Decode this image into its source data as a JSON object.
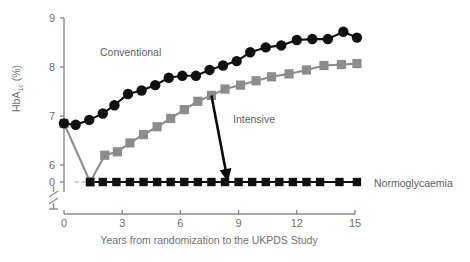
{
  "figure": {
    "background": "#ffffff",
    "colors": {
      "conventional": "#111111",
      "intensive": "#8c8c8c",
      "normoglycaemia": "#111111",
      "axis": "#8a8a8a",
      "text": "#6f6f6f"
    }
  },
  "chart_data": {
    "type": "line",
    "title": "",
    "xlabel": "Years from randomization to the UKPDS Study",
    "ylabel": "HbA1c (%)",
    "ylabel_main": "HbA",
    "ylabel_sub": "1c",
    "ylabel_units": " (%)",
    "xlim": [
      0,
      15.6
    ],
    "ylim": [
      5.6,
      9.1
    ],
    "axis_break": true,
    "axis_break_note": "y-axis broken between 6 and 0",
    "grid": false,
    "legend_position": "inline-annotations",
    "xticks": [
      0,
      3,
      6,
      9,
      12,
      15
    ],
    "xticklabels": [
      "0",
      "3",
      "6",
      "9",
      "12",
      "15"
    ],
    "yticks": [
      9,
      8,
      7,
      6,
      0
    ],
    "yticklabels": [
      "9",
      "8",
      "7",
      "6",
      "0"
    ],
    "series": [
      {
        "name": "Conventional",
        "marker": "circle",
        "color": "#111111",
        "label_position": {
          "x": 4.0,
          "y": 8.62
        },
        "x": [
          0.0,
          0.6,
          1.3,
          2.0,
          2.6,
          3.3,
          4.0,
          4.7,
          5.4,
          6.1,
          6.8,
          7.5,
          8.2,
          8.9,
          9.6,
          10.4,
          11.2,
          12.0,
          12.8,
          13.6,
          14.4,
          15.1
        ],
        "y": [
          6.85,
          6.82,
          6.92,
          7.05,
          7.22,
          7.45,
          7.52,
          7.63,
          7.78,
          7.82,
          7.82,
          7.94,
          8.03,
          8.12,
          8.3,
          8.4,
          8.44,
          8.55,
          8.57,
          8.57,
          8.72,
          8.6
        ]
      },
      {
        "name": "Intensive",
        "marker": "square",
        "color": "#8c8c8c",
        "label_position": {
          "x": 9.3,
          "y": 7.52
        },
        "x": [
          0.0,
          1.35,
          2.1,
          2.75,
          3.4,
          4.1,
          4.8,
          5.5,
          6.2,
          6.9,
          7.6,
          8.3,
          9.1,
          9.9,
          10.7,
          11.6,
          12.5,
          13.4,
          14.3,
          15.1
        ],
        "y": [
          6.85,
          5.62,
          6.2,
          6.27,
          6.45,
          6.62,
          6.78,
          6.95,
          7.13,
          7.3,
          7.42,
          7.55,
          7.63,
          7.72,
          7.8,
          7.86,
          7.94,
          8.03,
          8.05,
          8.07
        ]
      },
      {
        "name": "Normoglycaemia",
        "marker": "square",
        "color": "#111111",
        "label_position": {
          "x": 15.5,
          "y": 5.62
        },
        "x": [
          1.35,
          2.0,
          2.7,
          3.4,
          4.1,
          4.8,
          5.5,
          6.2,
          6.9,
          7.6,
          8.3,
          9.0,
          9.7,
          10.4,
          11.1,
          11.8,
          12.5,
          13.2,
          14.2,
          15.1
        ],
        "y": [
          5.62,
          5.62,
          5.62,
          5.62,
          5.62,
          5.62,
          5.62,
          5.62,
          5.62,
          5.62,
          5.62,
          5.62,
          5.62,
          5.62,
          5.62,
          5.62,
          5.62,
          5.62,
          5.62,
          5.62
        ]
      }
    ],
    "annotations": [
      {
        "name": "intensive-arrow",
        "type": "arrow",
        "from": {
          "x": 7.6,
          "y": 7.42
        },
        "to": {
          "x": 8.45,
          "y": 5.72
        }
      },
      {
        "name": "baseline-dash",
        "type": "dashed-segment",
        "from": {
          "x": 0.55,
          "y": 5.62
        },
        "to": {
          "x": 1.3,
          "y": 5.62
        }
      }
    ],
    "series_labels": {
      "conventional": "Conventional",
      "intensive": "Intensive",
      "normoglycaemia": "Normoglycaemia"
    }
  }
}
